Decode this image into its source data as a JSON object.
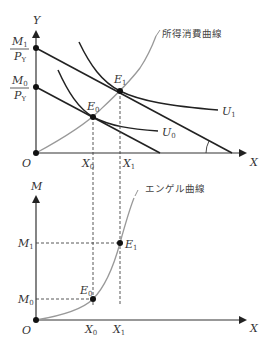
{
  "top_graph": {
    "y_axis_label": "Y",
    "x_axis_label": "X",
    "origin_label": "O",
    "intercepts": [
      {
        "num": "M",
        "num_sub": "1",
        "den": "P",
        "den_sub": "Y"
      },
      {
        "num": "M",
        "num_sub": "0",
        "den": "P",
        "den_sub": "Y"
      }
    ],
    "points": [
      {
        "label": "E",
        "sub": "0"
      },
      {
        "label": "E",
        "sub": "1"
      }
    ],
    "x_ticks": [
      {
        "label": "X",
        "sub": "0"
      },
      {
        "label": "X",
        "sub": "1"
      }
    ],
    "curves": [
      {
        "label": "U",
        "sub": "0"
      },
      {
        "label": "U",
        "sub": "1"
      }
    ],
    "icc_label": "所得消費曲線"
  },
  "bottom_graph": {
    "y_axis_label": "M",
    "x_axis_label": "X",
    "origin_label": "O",
    "y_ticks": [
      {
        "label": "M",
        "sub": "1"
      },
      {
        "label": "M",
        "sub": "0"
      }
    ],
    "points": [
      {
        "label": "E",
        "sub": "0"
      },
      {
        "label": "E",
        "sub": "1"
      }
    ],
    "x_ticks": [
      {
        "label": "X",
        "sub": "0"
      },
      {
        "label": "X",
        "sub": "1"
      }
    ],
    "engel_label": "エンゲル曲線"
  },
  "colors": {
    "axis": "#333333",
    "line": "#222222",
    "curve_gray": "#999999",
    "dashed": "#444444"
  }
}
